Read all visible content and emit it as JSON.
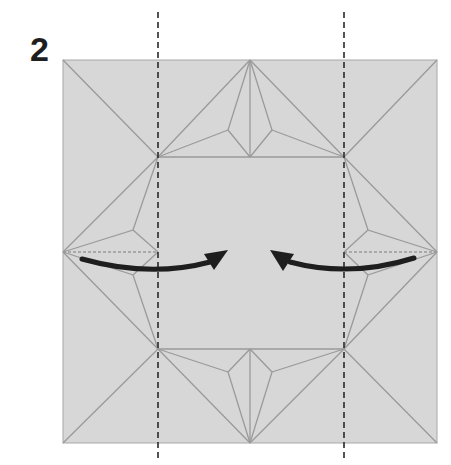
{
  "step": {
    "number": "2"
  },
  "diagram": {
    "paper_color": "#d7d7d7",
    "crease_color": "#9a9a9a",
    "fold_line_color": "#2a2a2a",
    "arrow_color": "#1e1e1e",
    "square": {
      "x": 63,
      "y": 60,
      "w": 374,
      "h": 383
    },
    "inner_square": {
      "x": 158,
      "y": 157,
      "w": 186,
      "h": 192
    },
    "valley_folds": [
      {
        "name": "left-valley-fold",
        "x": 158
      },
      {
        "name": "right-valley-fold",
        "x": 344
      }
    ],
    "arrows": [
      {
        "name": "left-fold-arrow",
        "direction": "right"
      },
      {
        "name": "right-fold-arrow",
        "direction": "left"
      }
    ]
  }
}
